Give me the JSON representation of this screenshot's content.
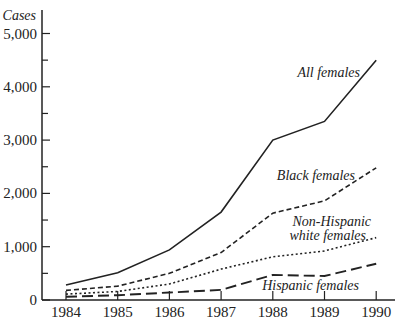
{
  "chart_data": {
    "type": "line",
    "title": "",
    "xlabel": "",
    "ylabel": "Cases",
    "ylim": [
      0,
      5300
    ],
    "yticks": [
      0,
      1000,
      2000,
      3000,
      4000,
      5000
    ],
    "ytick_labels": [
      "0",
      "1,000",
      "2,000",
      "3,000",
      "4,000",
      "5,000"
    ],
    "x": [
      1984,
      1985,
      1986,
      1987,
      1988,
      1989,
      1990
    ],
    "xtick_labels": [
      "1984",
      "1985",
      "1986",
      "1987",
      "1988",
      "1989",
      "1990"
    ],
    "grid": false,
    "legend": "inline labels",
    "series": [
      {
        "name": "All females",
        "style": "solid",
        "values": [
          280,
          510,
          940,
          1650,
          3000,
          3350,
          4500
        ]
      },
      {
        "name": "Black females",
        "style": "dashed",
        "values": [
          180,
          260,
          500,
          890,
          1630,
          1860,
          2480
        ]
      },
      {
        "name": "Non-Hispanic white females",
        "style": "dotted",
        "values": [
          110,
          160,
          300,
          580,
          810,
          920,
          1170
        ]
      },
      {
        "name": "Hispanic females",
        "style": "long-dashed",
        "values": [
          60,
          90,
          140,
          190,
          470,
          450,
          680
        ]
      }
    ]
  },
  "labels": {
    "y_title": "Cases",
    "all": "All females",
    "black": "Black females",
    "white_line1": "Non-Hispanic",
    "white_line2": "white females",
    "hispanic": "Hispanic females"
  }
}
